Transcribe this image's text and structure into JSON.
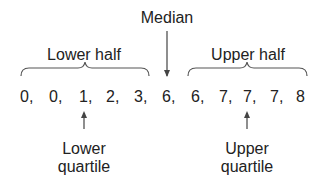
{
  "labels": {
    "median": "Median",
    "lower_half": "Lower half",
    "upper_half": "Upper half",
    "lower_quartile_line1": "Lower",
    "lower_quartile_line2": "quartile",
    "upper_quartile_line1": "Upper",
    "upper_quartile_line2": "quartile"
  },
  "values": [
    "0,",
    "0,",
    "1,",
    "2,",
    "3,",
    "6,",
    "6,",
    "7,",
    "7,",
    "7,",
    "8"
  ],
  "colors": {
    "text": "#222222",
    "lines": "#444444",
    "background": "#ffffff"
  }
}
